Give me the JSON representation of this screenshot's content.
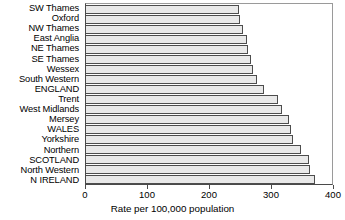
{
  "chart_data": {
    "type": "bar",
    "orientation": "horizontal",
    "title": "",
    "xlabel": "Rate per 100,000 population",
    "ylabel": "",
    "xlim": [
      0,
      400
    ],
    "xticks": [
      0,
      100,
      200,
      300,
      400
    ],
    "grid": false,
    "legend": null,
    "categories": [
      "SW Thames",
      "Oxford",
      "NW Thames",
      "East Anglia",
      "NE Thames",
      "SE Thames",
      "Wessex",
      "South Western",
      "ENGLAND",
      "Trent",
      "West Midlands",
      "Mersey",
      "WALES",
      "Yorkshire",
      "Northern",
      "SCOTLAND",
      "North Western",
      "N IRELAND"
    ],
    "values": [
      248,
      251,
      255,
      262,
      264,
      269,
      272,
      278,
      290,
      312,
      318,
      330,
      334,
      337,
      350,
      363,
      364,
      373
    ],
    "bar_color": "#e9e9e9",
    "bar_border_color": "#4d4d4d",
    "axis_color": "#4a4a4a"
  },
  "axis": {
    "x_tick_labels": [
      "0",
      "100",
      "200",
      "300",
      "400"
    ],
    "x_title": "Rate per 100,000 population"
  }
}
